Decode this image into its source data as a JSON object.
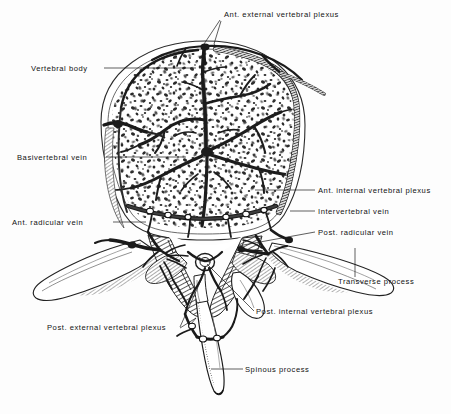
{
  "figure": {
    "background_color": "#fdfdfd",
    "ink_color": "#1a1a1a",
    "bone_fill": "#ffffff",
    "vein_color": "#232323",
    "labels": [
      {
        "id": "ant-external-vertebral-plexus",
        "text": "Ant. external vertebral plexus",
        "text_x": 224,
        "text_y": 17,
        "anchor": "start",
        "leader": "M220,20 L206,41 M221,21 L214,44",
        "leader2": "M206,41 L202,47 M214,44 L216,47"
      },
      {
        "id": "vertebral-body",
        "text": "Vertebral body",
        "text_x": 31,
        "text_y": 71,
        "anchor": "start",
        "leader": "M104,68 L196,68"
      },
      {
        "id": "basivertebral-vein",
        "text": "Basivertebral vein",
        "text_x": 17,
        "text_y": 160,
        "anchor": "start",
        "leader": "M106,157 L186,157"
      },
      {
        "id": "ant-internal-vertebral-plexus",
        "text": "Ant. internal vertebral plexus",
        "text_x": 318,
        "text_y": 193,
        "anchor": "start",
        "leader": "M315,190 L255,190"
      },
      {
        "id": "intervertebral-vein",
        "text": "Intervertebral vein",
        "text_x": 318,
        "text_y": 214,
        "anchor": "start",
        "leader": "M315,211 L290,211"
      },
      {
        "id": "ant-radicular-vein",
        "text": "Ant. radicular vein",
        "text_x": 12,
        "text_y": 225,
        "anchor": "start",
        "leader": "M113,222 L146,222"
      },
      {
        "id": "post-radicular-vein",
        "text": "Post. radicular vein",
        "text_x": 318,
        "text_y": 235,
        "anchor": "start",
        "leader": "M315,232 L238,246"
      },
      {
        "id": "transverse-process",
        "text": "Transverse process",
        "text_x": 338,
        "text_y": 284,
        "anchor": "start",
        "leader": "M355,277 L355,248"
      },
      {
        "id": "post-internal-vertebral-plexus",
        "text": "Post. internal vertebral plexus",
        "text_x": 256,
        "text_y": 314,
        "anchor": "start",
        "leader": "M254,311 L207,264"
      },
      {
        "id": "post-external-vertebral-plexus",
        "text": "Post. external vertebral plexus",
        "text_x": 47,
        "text_y": 330,
        "anchor": "start",
        "leader": "M180,327 L202,278 M180,328 L196,318",
        "leader2": "M196,318 L191,324"
      },
      {
        "id": "spinous-process",
        "text": "Spinous process",
        "text_x": 245,
        "text_y": 372,
        "anchor": "start",
        "leader": "M243,369 L211,369"
      }
    ],
    "structures": [
      {
        "id": "vertebral-body-cortex",
        "name": "vertebral body outline"
      },
      {
        "id": "cancellous-bone",
        "name": "cancellous bone stipple"
      },
      {
        "id": "basivertebral-vein-tree",
        "name": "basivertebral venous tree"
      },
      {
        "id": "right-rim-vein",
        "name": "anterior external plexus vein, right rim"
      },
      {
        "id": "left-rim-vein",
        "name": "anterior external plexus vein, left rim"
      },
      {
        "id": "vertebral-arch",
        "name": "vertebral arch and pedicles"
      },
      {
        "id": "transverse-process-left",
        "name": "left transverse process"
      },
      {
        "id": "transverse-process-right",
        "name": "right transverse process"
      },
      {
        "id": "spinous-process-shape",
        "name": "spinous process"
      },
      {
        "id": "vertebral-foramen",
        "name": "vertebral foramen"
      }
    ]
  }
}
